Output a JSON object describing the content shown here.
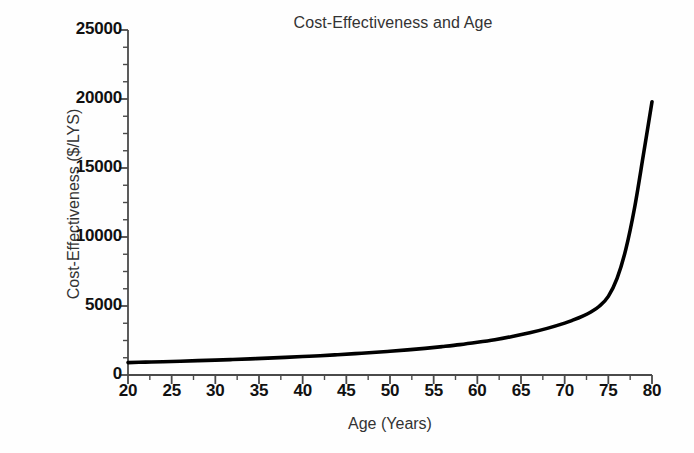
{
  "chart_data": {
    "type": "line",
    "title": "Cost-Effectiveness and Age",
    "xlabel": "Age (Years)",
    "ylabel": "Cost-Effectiveness ($/LYS)",
    "xlim": [
      20,
      80
    ],
    "ylim": [
      0,
      25000
    ],
    "xticks": [
      20,
      25,
      30,
      35,
      40,
      45,
      50,
      55,
      60,
      65,
      70,
      75,
      80
    ],
    "xtick_labels": [
      "20",
      "25",
      "30",
      "35",
      "40",
      "45",
      "50",
      "55",
      "60",
      "65",
      "70",
      "75",
      "80"
    ],
    "yticks": [
      0,
      5000,
      10000,
      15000,
      20000,
      25000
    ],
    "ytick_labels": [
      "0",
      "5000",
      "10000",
      "15000",
      "20000",
      "25000"
    ],
    "x_minor_interval": 2.5,
    "y_minor_interval": 1250,
    "grid": false,
    "legend": false,
    "legend_position": "none",
    "line_color": "#000000",
    "line_width_px": 3.6,
    "axis_color": "#4a4a4a",
    "background_color": "#fefefe",
    "series": [
      {
        "name": "Cost-Effectiveness",
        "x": [
          20,
          22,
          24,
          26,
          28,
          30,
          32,
          34,
          36,
          38,
          40,
          42,
          44,
          46,
          48,
          50,
          52,
          54,
          56,
          58,
          60,
          62,
          64,
          66,
          68,
          70,
          71,
          72,
          73,
          74,
          75,
          76,
          77,
          78,
          79,
          80
        ],
        "values": [
          900,
          930,
          960,
          1000,
          1040,
          1080,
          1120,
          1170,
          1220,
          1280,
          1340,
          1400,
          1470,
          1550,
          1630,
          1720,
          1820,
          1930,
          2060,
          2200,
          2370,
          2560,
          2790,
          3060,
          3380,
          3760,
          3990,
          4250,
          4560,
          5000,
          5700,
          7000,
          9100,
          12100,
          15900,
          19800
        ]
      }
    ]
  }
}
